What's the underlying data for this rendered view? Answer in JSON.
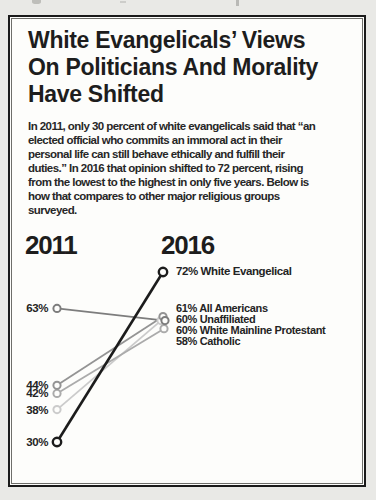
{
  "scan": {
    "outer_bg": "#e9e9e6",
    "card_bg": "#fdfdfb",
    "border_color": "#1a1a1a"
  },
  "header": {
    "title": "White Evangelicals’ Views\nOn Politicians And Morality\nHave Shifted",
    "intro": "In 2011, only 30 percent of white evangelicals said that “an\nelected official who commits an immoral act in their\npersonal life can still behave ethically and fulfill their\nduties.” In 2016 that opinion shifted to 72 percent, rising\nfrom the lowest to the highest in only five years. Below is\nhow that compares to other major religious groups\nsurveyed."
  },
  "chart_data": {
    "type": "slope",
    "col_headers": [
      "2011",
      "2016"
    ],
    "x": [
      "2011",
      "2016"
    ],
    "y_range": [
      30,
      72
    ],
    "series": [
      {
        "name": "White Evangelical",
        "values": [
          30,
          72
        ],
        "left_label": "30%",
        "color": "#1c1c1c"
      },
      {
        "name": "Unaffiliated",
        "values": [
          63,
          60
        ],
        "left_label": "63%",
        "color": "#7d7d7d"
      },
      {
        "name": "All Americans",
        "values": [
          44,
          61
        ],
        "left_label": "44%",
        "color": "#949494"
      },
      {
        "name": "Catholic",
        "values": [
          42,
          58
        ],
        "left_label": "42%",
        "color": "#ababab"
      },
      {
        "name": "White Mainline Protestant",
        "values": [
          38,
          60
        ],
        "left_label": "38%",
        "color": "#cbcbcb"
      }
    ],
    "right_labels": {
      "top": "72% White Evangelical",
      "group": [
        "61% All Americans",
        "60% Unaffiliated",
        "60% White Mainline Protestant",
        "58% Catholic"
      ]
    },
    "legend_position": "inline-labels",
    "grid": false
  }
}
